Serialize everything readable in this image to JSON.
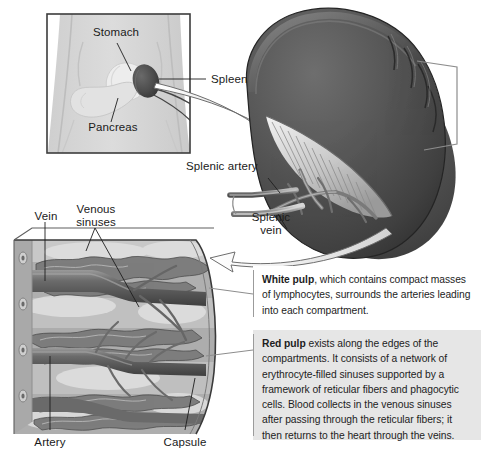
{
  "figure": {
    "background_color": "#ffffff"
  },
  "body_panel": {
    "name": "torso-inset",
    "border_color": "#3c3c3c",
    "skin_color": "#d8d8d8",
    "labels": [
      {
        "id": "stomach",
        "text": "Stomach"
      },
      {
        "id": "pancreas",
        "text": "Pancreas"
      },
      {
        "id": "spleen",
        "text": "Spleen"
      }
    ]
  },
  "organ": {
    "name": "spleen-illustration",
    "fill_color": "#4a4a4a",
    "labels": [
      {
        "id": "splenic-artery",
        "text": "Splenic artery"
      },
      {
        "id": "splenic-vein",
        "text": "Splenic\nvein"
      }
    ]
  },
  "cross_section": {
    "name": "spleen-cross-section",
    "labels": [
      {
        "id": "vein",
        "text": "Vein"
      },
      {
        "id": "venous-sinuses",
        "text": "Venous\nsinuses"
      },
      {
        "id": "artery",
        "text": "Artery"
      },
      {
        "id": "capsule",
        "text": "Capsule"
      }
    ]
  },
  "callouts": {
    "white_pulp": {
      "term": "White pulp",
      "body": ", which contains compact masses of lymphocytes, surrounds the arteries leading into each compartment.",
      "background": "#ffffff"
    },
    "red_pulp": {
      "term": "Red pulp",
      "body": " exists along the edges of the compartments. It consists of a network of erythrocyte-filled sinuses supported by a framework of reticular fibers and phagocytic cells. Blood collects in the venous sinuses after passing through the reticular fibers; it then returns to the heart through the veins.",
      "background": "#e6e6e6"
    }
  }
}
